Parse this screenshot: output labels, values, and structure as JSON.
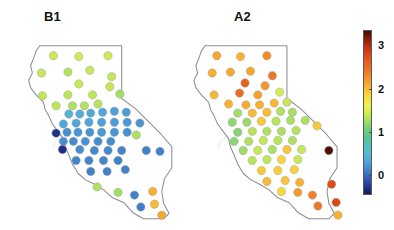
{
  "figure": {
    "top_clipped_text": "",
    "background": "#ffffff",
    "width": 394,
    "height": 230
  },
  "panels": [
    {
      "id": "B1",
      "label": "B1",
      "label_x": 44,
      "label_y": 9
    },
    {
      "id": "A2",
      "label": "A2",
      "label_x": 234,
      "label_y": 9
    }
  ],
  "colorbar": {
    "name": "value-colorbar",
    "x": 363,
    "y": 30,
    "width": 9,
    "height": 165,
    "vmin": -0.45,
    "vmax": 3.35,
    "ticks": [
      {
        "value": 3,
        "label": "3"
      },
      {
        "value": 2,
        "label": "2"
      },
      {
        "value": 1,
        "label": "1"
      },
      {
        "value": 0,
        "label": "0"
      }
    ],
    "colormap": "jet-dark-ends",
    "stops": [
      {
        "pos": 0.0,
        "color": "#3b0d05"
      },
      {
        "pos": 0.04,
        "color": "#7c1a06"
      },
      {
        "pos": 0.1,
        "color": "#c7300d"
      },
      {
        "pos": 0.17,
        "color": "#e4521a"
      },
      {
        "pos": 0.25,
        "color": "#ef7a24"
      },
      {
        "pos": 0.33,
        "color": "#f7aa2d"
      },
      {
        "pos": 0.4,
        "color": "#fbd93c"
      },
      {
        "pos": 0.46,
        "color": "#eef352"
      },
      {
        "pos": 0.53,
        "color": "#b8e35b"
      },
      {
        "pos": 0.6,
        "color": "#76cf7a"
      },
      {
        "pos": 0.67,
        "color": "#4fc3a0"
      },
      {
        "pos": 0.74,
        "color": "#56bed0"
      },
      {
        "pos": 0.81,
        "color": "#4ea3d8"
      },
      {
        "pos": 0.88,
        "color": "#3a6fc0"
      },
      {
        "pos": 0.95,
        "color": "#24379a"
      },
      {
        "pos": 1.0,
        "color": "#141a52"
      }
    ]
  },
  "chart_data": {
    "type": "scatter",
    "title": "",
    "subtitle": "",
    "xlabel": "",
    "ylabel": "",
    "grid": false,
    "legend_position": "right",
    "colorbar_label": "",
    "colorbar_range": [
      0,
      3
    ],
    "colorbar_ticks": [
      0,
      1,
      2,
      3
    ],
    "map_region": "California, USA",
    "panel_names": [
      "B1",
      "A2"
    ],
    "marker": "circle",
    "series": [
      {
        "name": "B1",
        "points": [
          {
            "x": 41,
            "y": 37,
            "v": 1.42
          },
          {
            "x": 69,
            "y": 38,
            "v": 1.44
          },
          {
            "x": 101,
            "y": 37,
            "v": 1.43
          },
          {
            "x": 28,
            "y": 56,
            "v": 1.4
          },
          {
            "x": 57,
            "y": 55,
            "v": 1.32
          },
          {
            "x": 81,
            "y": 53,
            "v": 1.4
          },
          {
            "x": 105,
            "y": 60,
            "v": 1.38
          },
          {
            "x": 69,
            "y": 68,
            "v": 1.41
          },
          {
            "x": 103,
            "y": 71,
            "v": 1.41
          },
          {
            "x": 29,
            "y": 81,
            "v": 1.38
          },
          {
            "x": 57,
            "y": 80,
            "v": 1.36
          },
          {
            "x": 84,
            "y": 80,
            "v": 1.37
          },
          {
            "x": 114,
            "y": 79,
            "v": 1.26
          },
          {
            "x": 44,
            "y": 92,
            "v": 1.37
          },
          {
            "x": 62,
            "y": 92,
            "v": 1.3
          },
          {
            "x": 75,
            "y": 92,
            "v": 1.31
          },
          {
            "x": 90,
            "y": 90,
            "v": 1.34
          },
          {
            "x": 58,
            "y": 101,
            "v": 0.44
          },
          {
            "x": 70,
            "y": 101,
            "v": 0.38
          },
          {
            "x": 82,
            "y": 100,
            "v": 0.34
          },
          {
            "x": 95,
            "y": 99,
            "v": 0.3
          },
          {
            "x": 108,
            "y": 98,
            "v": 0.26
          },
          {
            "x": 121,
            "y": 99,
            "v": 0.24
          },
          {
            "x": 52,
            "y": 112,
            "v": 0.32
          },
          {
            "x": 66,
            "y": 111,
            "v": 0.3
          },
          {
            "x": 80,
            "y": 110,
            "v": 0.28
          },
          {
            "x": 94,
            "y": 110,
            "v": 0.26
          },
          {
            "x": 108,
            "y": 110,
            "v": 0.24
          },
          {
            "x": 122,
            "y": 110,
            "v": 0.22
          },
          {
            "x": 136,
            "y": 111,
            "v": 0.2
          },
          {
            "x": 44,
            "y": 122,
            "v": -0.3
          },
          {
            "x": 56,
            "y": 121,
            "v": 0.18
          },
          {
            "x": 68,
            "y": 121,
            "v": 0.2
          },
          {
            "x": 81,
            "y": 121,
            "v": 0.2
          },
          {
            "x": 94,
            "y": 121,
            "v": 0.22
          },
          {
            "x": 108,
            "y": 121,
            "v": 0.2
          },
          {
            "x": 122,
            "y": 121,
            "v": 0.18
          },
          {
            "x": 52,
            "y": 131,
            "v": 0.16
          },
          {
            "x": 63,
            "y": 131,
            "v": 0.16
          },
          {
            "x": 76,
            "y": 131,
            "v": 0.18
          },
          {
            "x": 90,
            "y": 131,
            "v": 0.16
          },
          {
            "x": 104,
            "y": 131,
            "v": 0.16
          },
          {
            "x": 51,
            "y": 140,
            "v": -0.32
          },
          {
            "x": 70,
            "y": 140,
            "v": 0.16
          },
          {
            "x": 86,
            "y": 141,
            "v": 0.14
          },
          {
            "x": 101,
            "y": 141,
            "v": 0.14
          },
          {
            "x": 116,
            "y": 141,
            "v": 0.12
          },
          {
            "x": 132,
            "y": 124,
            "v": 1.3
          },
          {
            "x": 66,
            "y": 152,
            "v": 0.12
          },
          {
            "x": 80,
            "y": 152,
            "v": 0.12
          },
          {
            "x": 96,
            "y": 152,
            "v": 0.12
          },
          {
            "x": 112,
            "y": 152,
            "v": 0.1
          },
          {
            "x": 143,
            "y": 141,
            "v": 0.1
          },
          {
            "x": 158,
            "y": 142,
            "v": 0.1
          },
          {
            "x": 82,
            "y": 164,
            "v": 0.1
          },
          {
            "x": 100,
            "y": 164,
            "v": 0.1
          },
          {
            "x": 120,
            "y": 162,
            "v": 0.1
          },
          {
            "x": 89,
            "y": 181,
            "v": 1.3
          },
          {
            "x": 112,
            "y": 187,
            "v": 1.26
          },
          {
            "x": 130,
            "y": 190,
            "v": 0.1
          },
          {
            "x": 150,
            "y": 186,
            "v": 2.05
          },
          {
            "x": 152,
            "y": 200,
            "v": 2.0
          },
          {
            "x": 160,
            "y": 212,
            "v": 2.1
          },
          {
            "x": 137,
            "y": 203,
            "v": 0.08
          }
        ]
      },
      {
        "name": "A2",
        "points": [
          {
            "x": 7,
            "y": 37,
            "v": 2.12
          },
          {
            "x": 33,
            "y": 38,
            "v": 2.05
          },
          {
            "x": 62,
            "y": 37,
            "v": 2.28
          },
          {
            "x": 2,
            "y": 56,
            "v": 2.08
          },
          {
            "x": 22,
            "y": 55,
            "v": 2.1
          },
          {
            "x": 44,
            "y": 54,
            "v": 2.12
          },
          {
            "x": 68,
            "y": 59,
            "v": 2.44
          },
          {
            "x": 38,
            "y": 67,
            "v": 2.58
          },
          {
            "x": 60,
            "y": 70,
            "v": 2.22
          },
          {
            "x": 4,
            "y": 80,
            "v": 2.02
          },
          {
            "x": 32,
            "y": 78,
            "v": 2.5
          },
          {
            "x": 52,
            "y": 80,
            "v": 2.15
          },
          {
            "x": 76,
            "y": 77,
            "v": 1.48
          },
          {
            "x": 20,
            "y": 90,
            "v": 2.04
          },
          {
            "x": 39,
            "y": 91,
            "v": 2.08
          },
          {
            "x": 54,
            "y": 91,
            "v": 2.05
          },
          {
            "x": 70,
            "y": 89,
            "v": 2.02
          },
          {
            "x": 84,
            "y": 88,
            "v": 1.4
          },
          {
            "x": 30,
            "y": 100,
            "v": 1.25
          },
          {
            "x": 46,
            "y": 100,
            "v": 2.0
          },
          {
            "x": 62,
            "y": 99,
            "v": 2.0
          },
          {
            "x": 77,
            "y": 98,
            "v": 1.3
          },
          {
            "x": 90,
            "y": 99,
            "v": 1.28
          },
          {
            "x": 24,
            "y": 110,
            "v": 1.18
          },
          {
            "x": 40,
            "y": 110,
            "v": 1.22
          },
          {
            "x": 56,
            "y": 109,
            "v": 1.92
          },
          {
            "x": 72,
            "y": 109,
            "v": 1.34
          },
          {
            "x": 88,
            "y": 108,
            "v": 1.28
          },
          {
            "x": 104,
            "y": 108,
            "v": 1.3
          },
          {
            "x": 30,
            "y": 121,
            "v": 1.15
          },
          {
            "x": 46,
            "y": 120,
            "v": 1.34
          },
          {
            "x": 62,
            "y": 120,
            "v": 1.3
          },
          {
            "x": 78,
            "y": 120,
            "v": 1.28
          },
          {
            "x": 94,
            "y": 119,
            "v": 1.32
          },
          {
            "x": 117,
            "y": 114,
            "v": 1.92
          },
          {
            "x": 26,
            "y": 131,
            "v": 1.16
          },
          {
            "x": 42,
            "y": 131,
            "v": 1.3
          },
          {
            "x": 58,
            "y": 130,
            "v": 1.38
          },
          {
            "x": 74,
            "y": 130,
            "v": 1.34
          },
          {
            "x": 90,
            "y": 130,
            "v": 1.3
          },
          {
            "x": 36,
            "y": 141,
            "v": 1.24
          },
          {
            "x": 52,
            "y": 141,
            "v": 1.42
          },
          {
            "x": 68,
            "y": 140,
            "v": 1.3
          },
          {
            "x": 84,
            "y": 140,
            "v": 1.95
          },
          {
            "x": 100,
            "y": 140,
            "v": 1.4
          },
          {
            "x": 46,
            "y": 152,
            "v": 1.35
          },
          {
            "x": 62,
            "y": 151,
            "v": 1.38
          },
          {
            "x": 78,
            "y": 151,
            "v": 1.85
          },
          {
            "x": 96,
            "y": 151,
            "v": 1.42
          },
          {
            "x": 130,
            "y": 141,
            "v": 3.3
          },
          {
            "x": 56,
            "y": 163,
            "v": 1.92
          },
          {
            "x": 74,
            "y": 163,
            "v": 1.9
          },
          {
            "x": 92,
            "y": 162,
            "v": 1.88
          },
          {
            "x": 62,
            "y": 175,
            "v": 2.0
          },
          {
            "x": 82,
            "y": 174,
            "v": 1.95
          },
          {
            "x": 98,
            "y": 176,
            "v": 2.05
          },
          {
            "x": 78,
            "y": 186,
            "v": 1.85
          },
          {
            "x": 96,
            "y": 187,
            "v": 2.2
          },
          {
            "x": 112,
            "y": 190,
            "v": 2.35
          },
          {
            "x": 118,
            "y": 202,
            "v": 2.4
          },
          {
            "x": 133,
            "y": 178,
            "v": 2.75
          },
          {
            "x": 138,
            "y": 198,
            "v": 2.78
          },
          {
            "x": 140,
            "y": 212,
            "v": 2.05
          }
        ]
      }
    ]
  }
}
